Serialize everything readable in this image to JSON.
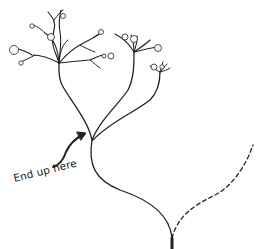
{
  "figure": {
    "annotation": {
      "text": "End up here",
      "arrow": "curved-arrow-pointing-to-branch-node"
    },
    "colors": {
      "background": "#ffffff",
      "stroke": "#222222",
      "blossom_fill": "#ffffff"
    },
    "elements": {
      "solid_path": "branching tree taken path",
      "dashed_path": "alternative path not taken"
    }
  }
}
